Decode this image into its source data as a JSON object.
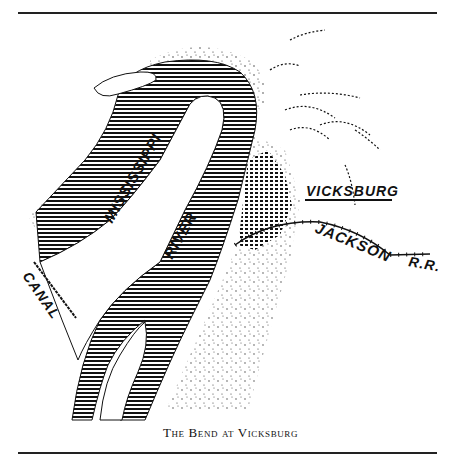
{
  "map": {
    "caption": "The Bend at Vicksburg",
    "labels": {
      "river_upper": "MISSISSIPPI",
      "river_lower": "RIVER",
      "town": "VICKSBURG",
      "railroad_1": "JACKSON",
      "railroad_2": "R.R.",
      "canal": "CANAL"
    },
    "colors": {
      "ink": "#111111",
      "paper": "#ffffff"
    }
  }
}
